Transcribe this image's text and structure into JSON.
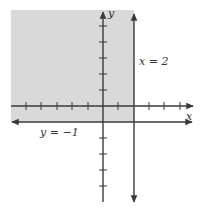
{
  "diagram": {
    "type": "coordinate-plane-inequality",
    "axes": {
      "x_label": "x",
      "y_label": "y",
      "x_ticks": [
        -5,
        -4,
        -3,
        -2,
        -1,
        1,
        2,
        3,
        4,
        5
      ],
      "y_ticks": [
        -4,
        -3,
        -2,
        -1,
        1,
        2,
        3,
        4,
        5
      ]
    },
    "lines": [
      {
        "equation": "x = 2",
        "label": "x = 2",
        "style": "solid",
        "direction": "vertical"
      },
      {
        "equation": "y = -1",
        "label": "y = −1",
        "style": "solid",
        "direction": "horizontal"
      }
    ],
    "shaded_region": {
      "description": "x ≤ 2 and y ≥ -1",
      "color": "#d9d9d9"
    },
    "colors": {
      "line": "#3a3a3a",
      "shade": "#d9d9d9",
      "background": "#ffffff"
    }
  },
  "labels": {
    "x_axis": "x",
    "y_axis": "y",
    "vertical_line": "x = 2",
    "horizontal_line": "y = −1"
  }
}
